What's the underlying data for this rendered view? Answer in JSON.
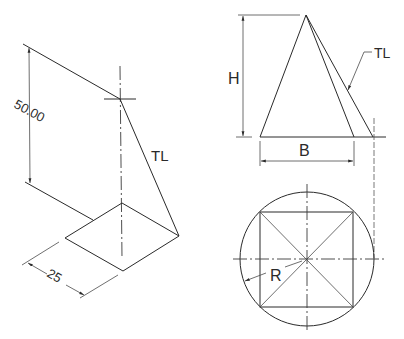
{
  "left_view": {
    "height_dimension": "50.00",
    "base_dimension": "25",
    "true_length_label": "TL"
  },
  "right_view": {
    "height_label": "H",
    "base_label": "B",
    "true_length_label": "TL",
    "radius_label": "R"
  },
  "colors": {
    "line": "#2a2a2a",
    "background": "#ffffff"
  }
}
